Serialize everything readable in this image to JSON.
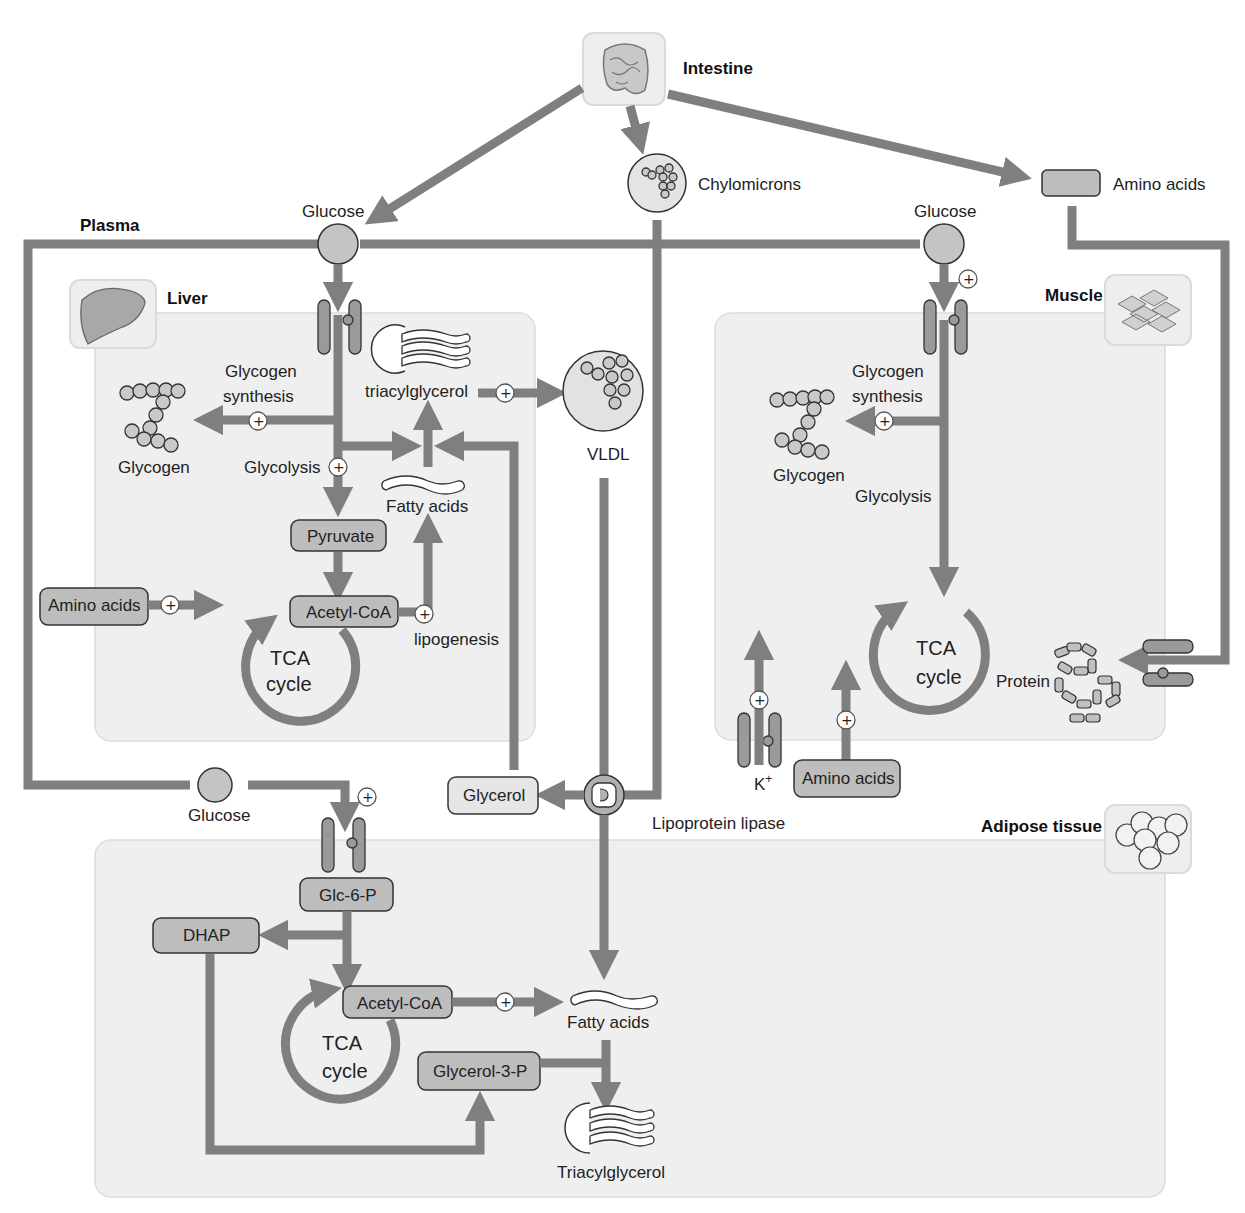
{
  "organs": {
    "intestine": "Intestine",
    "plasma": "Plasma",
    "liver": "Liver",
    "muscle": "Muscle",
    "adipose": "Adipose tissue"
  },
  "top": {
    "chylomicrons": "Chylomicrons",
    "amino_acids": "Amino acids",
    "glucose_left": "Glucose",
    "glucose_right": "Glucose"
  },
  "liver": {
    "glycogen_synthesis_1": "Glycogen",
    "glycogen_synthesis_2": "synthesis",
    "glycogen": "Glycogen",
    "glycolysis": "Glycolysis",
    "triacylglycerol": "triacylglycerol",
    "fatty_acids": "Fatty acids",
    "pyruvate": "Pyruvate",
    "amino_acids": "Amino acids",
    "acetyl_coa": "Acetyl-CoA",
    "lipogenesis": "lipogenesis",
    "tca_1": "TCA",
    "tca_2": "cycle",
    "vldl": "VLDL"
  },
  "muscle": {
    "glycogen_synthesis_1": "Glycogen",
    "glycogen_synthesis_2": "synthesis",
    "glycogen": "Glycogen",
    "glycolysis": "Glycolysis",
    "tca_1": "TCA",
    "tca_2": "cycle",
    "protein": "Protein",
    "k_ion": "K",
    "k_charge": "+",
    "amino_acids": "Amino acids"
  },
  "middle": {
    "glycerol": "Glycerol",
    "lipoprotein_lipase": "Lipoprotein lipase",
    "glucose": "Glucose"
  },
  "adipose": {
    "glc6p": "Glc-6-P",
    "dhap": "DHAP",
    "acetyl_coa": "Acetyl-CoA",
    "tca_1": "TCA",
    "tca_2": "cycle",
    "glycerol3p": "Glycerol-3-P",
    "fatty_acids": "Fatty acids",
    "triacylglycerol": "Triacylglycerol"
  },
  "symbols": {
    "plus": "+"
  },
  "colors": {
    "flow": "#7f7f7f",
    "tissue_bg": "#efefef",
    "box_fill": "#bdbdbd",
    "box_light": "#e6e6e6"
  }
}
